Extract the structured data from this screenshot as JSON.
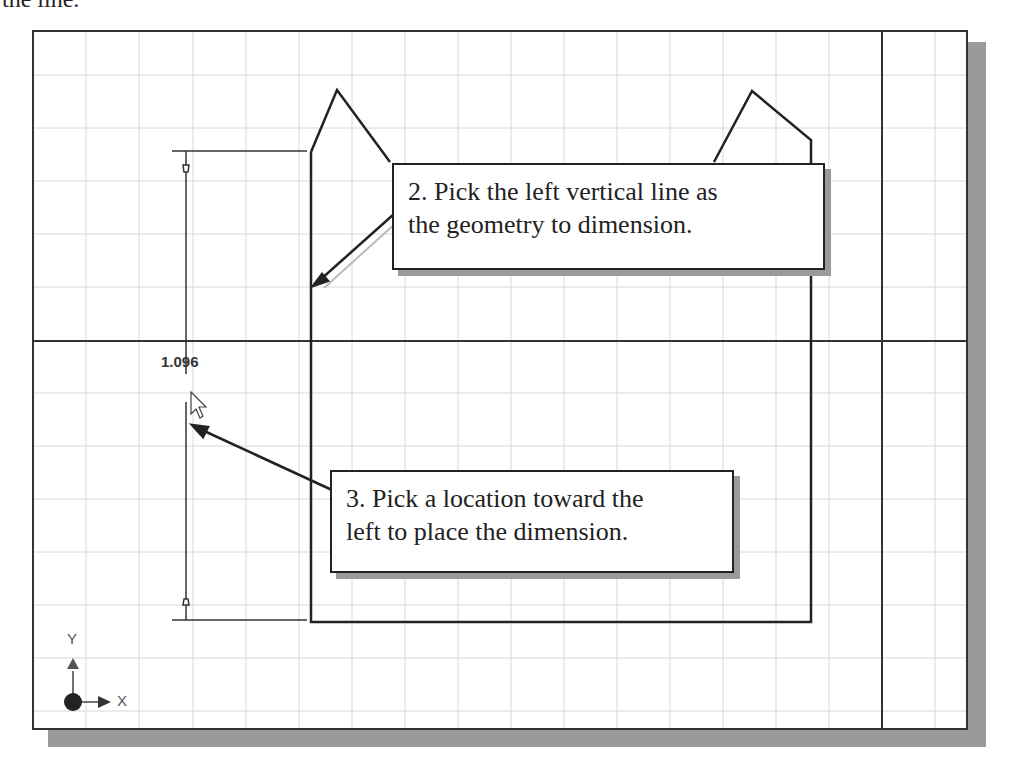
{
  "caption_fragment": "the line.",
  "sketch": {
    "dimension_value": "1.096",
    "triad": {
      "x_label": "X",
      "y_label": "Y"
    },
    "colors": {
      "geometry": "#222222",
      "grid": "#d8d8d8",
      "axis": "#333333",
      "shadow": "#9a9a9a"
    }
  },
  "callouts": [
    {
      "id": "step-2",
      "lines": [
        "2. Pick the left vertical line as",
        "the geometry to dimension."
      ]
    },
    {
      "id": "step-3",
      "lines": [
        "3. Pick a location toward the",
        "left to place the dimension."
      ]
    }
  ]
}
